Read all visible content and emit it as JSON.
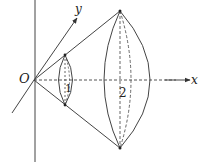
{
  "diagram": {
    "type": "geometry-3d-rotation",
    "labels": {
      "origin": "O",
      "x_axis": "x",
      "y_axis": "y",
      "solid_small": "1",
      "solid_large": "2"
    },
    "colors": {
      "line": "#333333",
      "background": "#ffffff"
    },
    "points": {
      "origin": [
        34,
        80
      ],
      "small_top": [
        65,
        55
      ],
      "small_bottom": [
        65,
        105
      ],
      "large_top": [
        120,
        11
      ],
      "large_bottom": [
        120,
        148
      ]
    }
  }
}
